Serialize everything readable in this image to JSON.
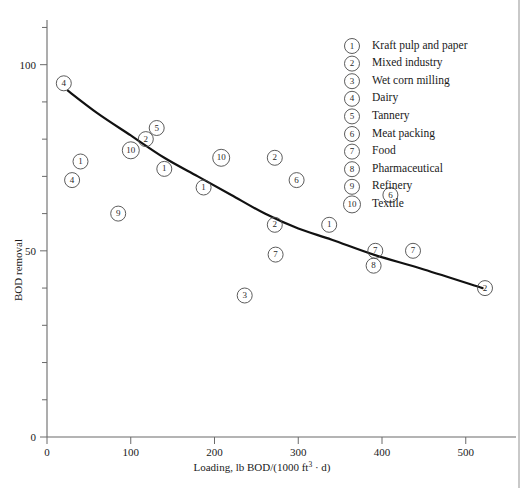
{
  "chart_data": {
    "type": "scatter",
    "title": "",
    "xlabel": "Loading, lb BOD/(1000 ft³ · d)",
    "ylabel": "BOD removal",
    "xlim": [
      0,
      560
    ],
    "ylim": [
      0,
      112
    ],
    "x_ticks": [
      0,
      100,
      200,
      300,
      400,
      500
    ],
    "y_ticks": [
      0,
      50,
      100
    ],
    "y_minor_step": 10,
    "x_minor": false,
    "grid": false,
    "legend_position": "top-right",
    "legend": [
      {
        "id": "1",
        "label": "Kraft pulp and paper"
      },
      {
        "id": "2",
        "label": "Mixed industry"
      },
      {
        "id": "3",
        "label": "Wet corn milling"
      },
      {
        "id": "4",
        "label": "Dairy"
      },
      {
        "id": "5",
        "label": "Tannery"
      },
      {
        "id": "6",
        "label": "Meat packing"
      },
      {
        "id": "7",
        "label": "Food"
      },
      {
        "id": "8",
        "label": "Pharmaceutical"
      },
      {
        "id": "9",
        "label": "Refinery"
      },
      {
        "id": "10",
        "label": "Textile"
      }
    ],
    "points": [
      {
        "id": "4",
        "x": 20,
        "y": 95
      },
      {
        "id": "1",
        "x": 40,
        "y": 74
      },
      {
        "id": "4",
        "x": 30,
        "y": 69
      },
      {
        "id": "10",
        "x": 100,
        "y": 77
      },
      {
        "id": "2",
        "x": 118,
        "y": 80
      },
      {
        "id": "5",
        "x": 131,
        "y": 83
      },
      {
        "id": "1",
        "x": 140,
        "y": 72
      },
      {
        "id": "9",
        "x": 85,
        "y": 60
      },
      {
        "id": "1",
        "x": 187,
        "y": 67
      },
      {
        "id": "10",
        "x": 208,
        "y": 75
      },
      {
        "id": "2",
        "x": 272,
        "y": 75
      },
      {
        "id": "6",
        "x": 298,
        "y": 69
      },
      {
        "id": "2",
        "x": 272,
        "y": 57
      },
      {
        "id": "1",
        "x": 337,
        "y": 57
      },
      {
        "id": "7",
        "x": 273,
        "y": 49
      },
      {
        "id": "3",
        "x": 236,
        "y": 38
      },
      {
        "id": "6",
        "x": 410,
        "y": 65
      },
      {
        "id": "7",
        "x": 392,
        "y": 50
      },
      {
        "id": "8",
        "x": 390,
        "y": 46
      },
      {
        "id": "7",
        "x": 437,
        "y": 50
      },
      {
        "id": "2",
        "x": 523,
        "y": 40
      }
    ],
    "trend_curve": [
      {
        "x": 25,
        "y": 93
      },
      {
        "x": 60,
        "y": 87
      },
      {
        "x": 100,
        "y": 81
      },
      {
        "x": 140,
        "y": 75
      },
      {
        "x": 180,
        "y": 70
      },
      {
        "x": 220,
        "y": 65
      },
      {
        "x": 260,
        "y": 60
      },
      {
        "x": 300,
        "y": 56
      },
      {
        "x": 340,
        "y": 53
      },
      {
        "x": 390,
        "y": 49
      },
      {
        "x": 450,
        "y": 45
      },
      {
        "x": 520,
        "y": 40
      }
    ]
  }
}
